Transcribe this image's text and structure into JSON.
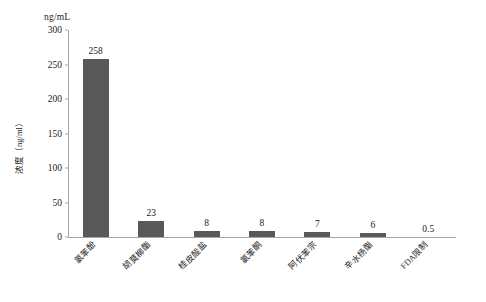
{
  "chart_data": {
    "type": "bar",
    "title": "",
    "subtitle": "",
    "unit_caption": "ng/mL",
    "xlabel": "",
    "ylabel": "浓度（ng/ml）",
    "ylim": [
      0,
      300
    ],
    "yticks": [
      0,
      50,
      100,
      150,
      200,
      250,
      300
    ],
    "ytick_labels": [
      "0",
      "50",
      "100",
      "150",
      "200",
      "250",
      "300"
    ],
    "grid": false,
    "legend": "none",
    "bar_color": "#595959",
    "axis_color": "#a6a6a6",
    "categories": [
      "氯苯酚",
      "胡莫柳酯",
      "桂皮酸盐",
      "氯苯酮",
      "阿伏苯宗",
      "辛水杨酯",
      "FDA限制"
    ],
    "values": [
      258,
      23,
      8,
      8,
      7,
      6,
      0.5
    ],
    "value_labels": [
      "258",
      "23",
      "8",
      "8",
      "7",
      "6",
      "0.5"
    ]
  }
}
